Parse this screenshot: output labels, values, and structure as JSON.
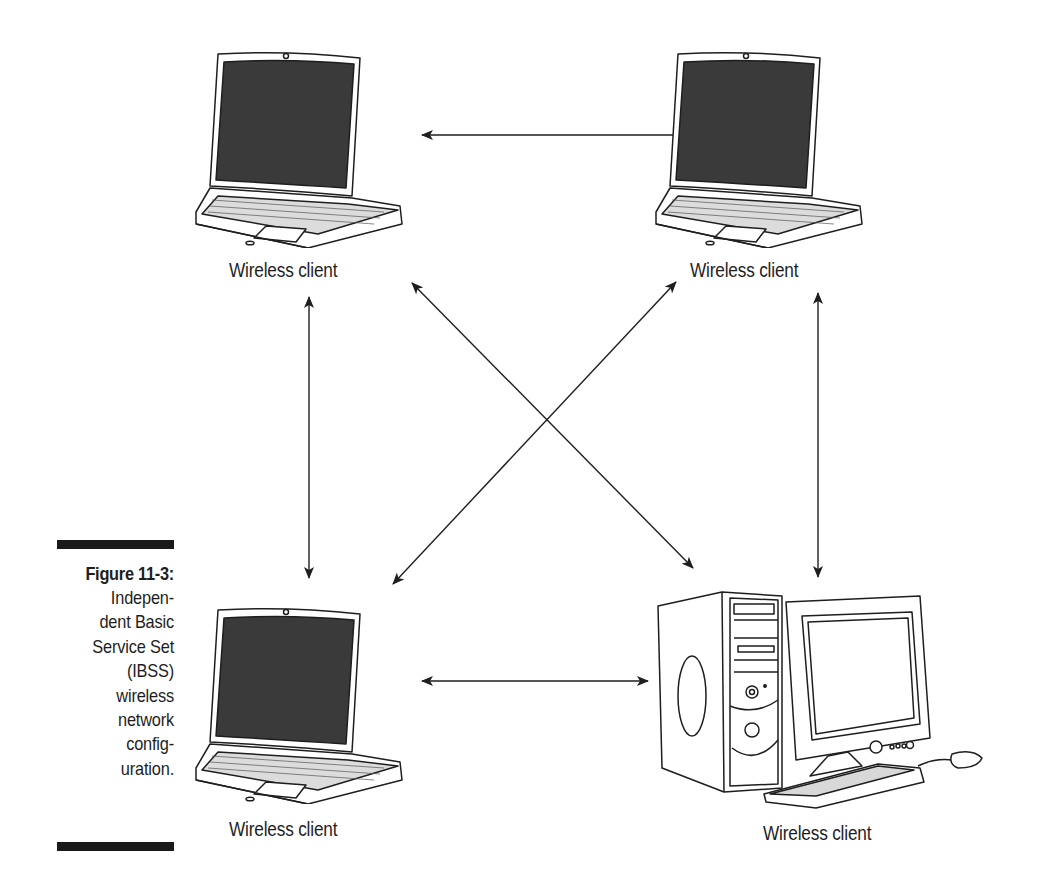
{
  "figure": {
    "number_label": "Figure 11-3:",
    "caption_lines": [
      "Indepen-",
      "dent Basic",
      "Service Set",
      "(IBSS)",
      "wireless",
      "network",
      "config-",
      "uration."
    ]
  },
  "nodes": [
    {
      "id": "top-left",
      "device": "laptop",
      "label": "Wireless client"
    },
    {
      "id": "top-right",
      "device": "laptop",
      "label": "Wireless client"
    },
    {
      "id": "bottom-left",
      "device": "laptop",
      "label": "Wireless client"
    },
    {
      "id": "bottom-right",
      "device": "desktop-pc",
      "label": "Wireless client"
    }
  ],
  "connections": [
    {
      "from": "top-left",
      "to": "top-right",
      "type": "bidirectional"
    },
    {
      "from": "top-left",
      "to": "bottom-left",
      "type": "bidirectional"
    },
    {
      "from": "top-left",
      "to": "bottom-right",
      "type": "bidirectional"
    },
    {
      "from": "top-right",
      "to": "bottom-left",
      "type": "bidirectional"
    },
    {
      "from": "top-right",
      "to": "bottom-right",
      "type": "bidirectional"
    },
    {
      "from": "bottom-left",
      "to": "bottom-right",
      "type": "bidirectional"
    }
  ],
  "colors": {
    "ink": "#1e1e1e",
    "screen": "#3a3a3a",
    "paper": "#ffffff"
  }
}
